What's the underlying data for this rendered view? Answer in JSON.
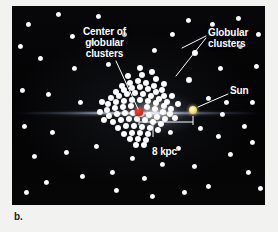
{
  "figure": {
    "caption": "b.",
    "panel_background": "#050505"
  },
  "annotations": {
    "center_of_clusters": "Center of\nglobular\nclusters",
    "globular_clusters": "Globular\nclusters",
    "sun": "Sun",
    "distance": "8 kpc"
  },
  "markers": {
    "galactic_center": {
      "name": "galactic-center-marker",
      "color": "#d2321f",
      "x": 127,
      "y": 106,
      "r": 3.6
    },
    "sun": {
      "name": "sun-marker",
      "color": "#f0dc72",
      "x": 181,
      "y": 104,
      "r": 4.2
    }
  },
  "scale_bar": {
    "label": "8 kpc",
    "x1": 127,
    "x2": 181,
    "y": 116
  },
  "chart_data": {
    "type": "scatter",
    "xlabel": "",
    "ylabel": "",
    "annotations": [
      "Center of globular clusters",
      "Globular clusters",
      "Sun",
      "8 kpc"
    ],
    "series": [
      {
        "name": "globular clusters",
        "note": "dense spheroidal swarm centered on the galactic center",
        "points": [
          [
            110,
            80
          ],
          [
            118,
            77
          ],
          [
            126,
            75
          ],
          [
            134,
            77
          ],
          [
            142,
            80
          ],
          [
            150,
            84
          ],
          [
            104,
            86
          ],
          [
            112,
            84
          ],
          [
            120,
            82
          ],
          [
            128,
            81
          ],
          [
            136,
            83
          ],
          [
            144,
            86
          ],
          [
            152,
            90
          ],
          [
            99,
            92
          ],
          [
            107,
            90
          ],
          [
            115,
            88
          ],
          [
            123,
            87
          ],
          [
            131,
            88
          ],
          [
            139,
            90
          ],
          [
            147,
            93
          ],
          [
            155,
            96
          ],
          [
            96,
            98
          ],
          [
            104,
            96
          ],
          [
            112,
            95
          ],
          [
            120,
            94
          ],
          [
            128,
            94
          ],
          [
            136,
            95
          ],
          [
            144,
            97
          ],
          [
            152,
            100
          ],
          [
            159,
            103
          ],
          [
            95,
            104
          ],
          [
            103,
            102
          ],
          [
            111,
            101
          ],
          [
            119,
            100
          ],
          [
            135,
            101
          ],
          [
            143,
            103
          ],
          [
            151,
            106
          ],
          [
            158,
            108
          ],
          [
            97,
            110
          ],
          [
            105,
            108
          ],
          [
            113,
            107
          ],
          [
            121,
            107
          ],
          [
            129,
            108
          ],
          [
            137,
            109
          ],
          [
            145,
            111
          ],
          [
            153,
            113
          ],
          [
            101,
            116
          ],
          [
            109,
            114
          ],
          [
            117,
            113
          ],
          [
            125,
            113
          ],
          [
            133,
            114
          ],
          [
            141,
            116
          ],
          [
            149,
            118
          ],
          [
            106,
            122
          ],
          [
            114,
            120
          ],
          [
            122,
            120
          ],
          [
            130,
            121
          ],
          [
            138,
            122
          ],
          [
            146,
            124
          ],
          [
            112,
            128
          ],
          [
            120,
            127
          ],
          [
            128,
            127
          ],
          [
            136,
            128
          ],
          [
            118,
            133
          ],
          [
            126,
            133
          ],
          [
            134,
            134
          ],
          [
            124,
            139
          ],
          [
            132,
            139
          ],
          [
            116,
            70
          ],
          [
            130,
            69
          ],
          [
            144,
            73
          ],
          [
            160,
            90
          ],
          [
            166,
            98
          ],
          [
            163,
            112
          ],
          [
            90,
            96
          ],
          [
            88,
            106
          ],
          [
            92,
            114
          ],
          [
            128,
            62
          ],
          [
            140,
            66
          ],
          [
            152,
            78
          ]
        ]
      },
      {
        "name": "outlying globular clusters (labeled)",
        "points": [
          [
            183,
            47
          ],
          [
            177,
            74
          ]
        ]
      },
      {
        "name": "field stars",
        "points": [
          [
            16,
            18
          ],
          [
            46,
            8
          ],
          [
            80,
            36
          ],
          [
            112,
            28
          ],
          [
            28,
            52
          ],
          [
            62,
            62
          ],
          [
            96,
            58
          ],
          [
            10,
            84
          ],
          [
            36,
            88
          ],
          [
            68,
            96
          ],
          [
            12,
            120
          ],
          [
            40,
            126
          ],
          [
            22,
            150
          ],
          [
            54,
            146
          ],
          [
            84,
            140
          ],
          [
            70,
            170
          ],
          [
            34,
            176
          ],
          [
            100,
            166
          ],
          [
            14,
            186
          ],
          [
            120,
            152
          ],
          [
            132,
            172
          ],
          [
            150,
            158
          ],
          [
            104,
            184
          ],
          [
            140,
            190
          ],
          [
            166,
            142
          ],
          [
            182,
            160
          ],
          [
            196,
            180
          ],
          [
            172,
            186
          ],
          [
            206,
            130
          ],
          [
            218,
            148
          ],
          [
            232,
            120
          ],
          [
            240,
            96
          ],
          [
            244,
            60
          ],
          [
            228,
            40
          ],
          [
            208,
            62
          ],
          [
            196,
            92
          ],
          [
            214,
            96
          ],
          [
            236,
            166
          ],
          [
            248,
            182
          ],
          [
            160,
            28
          ],
          [
            142,
            44
          ],
          [
            176,
            14
          ],
          [
            200,
            18
          ],
          [
            226,
            12
          ],
          [
            246,
            28
          ],
          [
            86,
            10
          ],
          [
            60,
            30
          ],
          [
            8,
            40
          ],
          [
            240,
            136
          ],
          [
            188,
            122
          ],
          [
            210,
            108
          ],
          [
            158,
            126
          ]
        ]
      }
    ]
  }
}
